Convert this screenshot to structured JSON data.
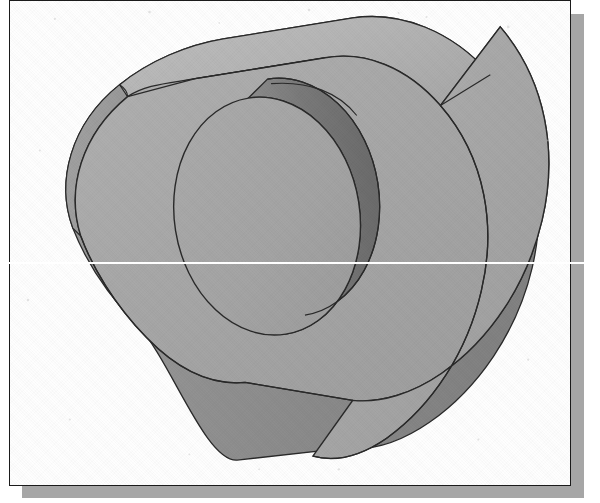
{
  "document": {
    "kind": "cad-isometric-view",
    "background_color": "#ffffff",
    "page_color": "#fefefe",
    "frame_border_color": "#1b1b1b",
    "frame_shadow_color": "#a6a6a6",
    "scanline_color": "#ffffff"
  },
  "frame": {
    "x": 9,
    "y": 0,
    "width": 562,
    "height": 486,
    "border_width": 1.5,
    "shadow_offset_x": 13,
    "shadow_offset_y": 14
  },
  "scanline": {
    "y": 262,
    "thickness": 2,
    "label": "horizontal-white-scan-artifact"
  },
  "model": {
    "name": "slot-prism-with-cylindrical-boss",
    "description": "Isometric shaded solid: an obround (stadium) extruded prism with a circular boss on the front face",
    "edge_color": "#2a2a2a",
    "edge_width": 1.4,
    "faces": {
      "front_face_color": "#a9a9a9",
      "top_face_color": "#b7b7b7",
      "left_cap_band_color": "#9a9a9a",
      "right_cap_band_color": "#8f8f8f",
      "boss_face_color": "#a6a6a6",
      "boss_side_color": "#7d7d7d",
      "boss_side_shadow_color": "#6e6e6e"
    },
    "geometry": {
      "front_face_outline": "M 137,335 L 71,236 A 96,125 0 0 1 177,46 L 371,22 A 118,150 0 0 1 545,243 A 118,150 0 0 1 401,451 L 240,468 A 96,125 0 0 1 137,335 Z",
      "boss": {
        "center_x": 258,
        "center_y": 216,
        "radius_x": 93,
        "radius_y": 120,
        "rotation_deg": -9,
        "depth_x": 22,
        "depth_y": 16
      },
      "extrusion_vector": {
        "dx": 120,
        "dy": -62
      }
    }
  },
  "legend": {
    "view_label": "isometric",
    "shading": "flat-grayscale"
  }
}
